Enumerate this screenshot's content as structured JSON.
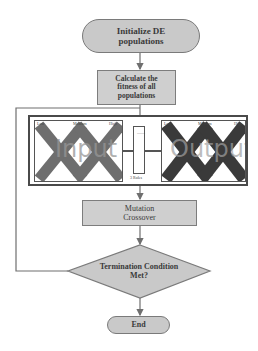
{
  "flowchart": {
    "start": {
      "label_line1": "Initialize DE",
      "label_line2": "populations"
    },
    "fitness": {
      "label_line1": "Calculate the",
      "label_line2": "fitness of all",
      "label_line3": "populations"
    },
    "fis_figure": {
      "input_chart": {
        "watermark": "Input",
        "top_labels": [
          "Low",
          "Medium",
          "High"
        ],
        "y_ticks": [
          "0.8",
          "0.6",
          "0.4",
          "0.2"
        ],
        "x_ticks": [
          "0",
          "0.2",
          "0.4",
          "0.6",
          "0.8",
          "1"
        ]
      },
      "rules_box": {
        "caption": "3 Rules",
        "dots": "........"
      },
      "output_chart": {
        "watermark": "Output",
        "top_labels": [
          "Low",
          "Medium",
          "High"
        ],
        "y_ticks": [
          "0.8",
          "0.6",
          "0.4",
          "0.2"
        ],
        "x_ticks": [
          "0",
          "0.2",
          "0.4",
          "0.6",
          "0.8",
          "1"
        ]
      }
    },
    "mutation": {
      "label_line1": "Mutation",
      "label_line2": "Crossover"
    },
    "decision": {
      "label_line1": "Termination Condition",
      "label_line2": "Met?"
    },
    "end": {
      "label": "End"
    }
  },
  "colors": {
    "node_fill": "#c9c9c9",
    "node_border": "#7a7a7a",
    "connector": "#6f6f6f",
    "input_mf": "#6e6e6e",
    "output_mf": "#3a3a3a"
  }
}
